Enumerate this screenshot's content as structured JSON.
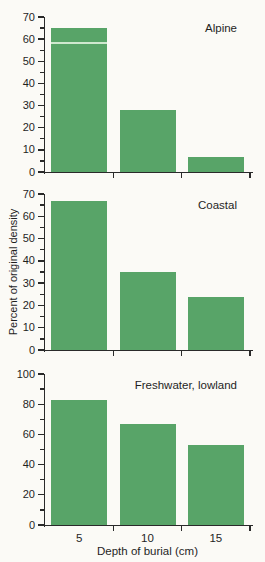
{
  "figure": {
    "ylabel": "Percent of original density",
    "xlabel": "Depth of burial (cm)"
  },
  "colors": {
    "bar": "#58a468",
    "axis": "#2a2a2a",
    "text": "#1f1f1f",
    "background": "#fbfaf6",
    "artifact_line": "#cfe8cf"
  },
  "chart_data": [
    {
      "type": "bar",
      "title": "Alpine",
      "categories": [
        "5",
        "10",
        "15"
      ],
      "values": [
        65,
        28,
        7
      ],
      "ylim": [
        0,
        70
      ],
      "ylabel_tick_step": 10,
      "minor_tick_step": 5,
      "show_x_tick_labels": false,
      "grid": false,
      "artifact_line": {
        "bar_index": 0,
        "value": 58.5
      }
    },
    {
      "type": "bar",
      "title": "Coastal",
      "categories": [
        "5",
        "10",
        "15"
      ],
      "values": [
        67,
        35,
        24
      ],
      "ylim": [
        0,
        70
      ],
      "ylabel_tick_step": 10,
      "minor_tick_step": 5,
      "show_x_tick_labels": false,
      "grid": false,
      "ylabel": "Percent of original density"
    },
    {
      "type": "bar",
      "title": "Freshwater, lowland",
      "categories": [
        "5",
        "10",
        "15"
      ],
      "values": [
        83,
        67,
        53
      ],
      "ylim": [
        0,
        100
      ],
      "ylabel_tick_step": 20,
      "minor_tick_step": 10,
      "show_x_tick_labels": true,
      "grid": false,
      "xlabel": "Depth of burial (cm)"
    }
  ]
}
